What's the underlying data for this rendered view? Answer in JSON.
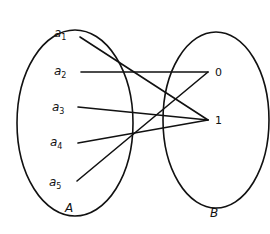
{
  "diagram": {
    "type": "function-mapping",
    "colors": {
      "stroke": "#111111",
      "background": "#ffffff"
    },
    "sets": [
      {
        "name": "A",
        "label": "A",
        "ellipse": {
          "cx": 75,
          "cy": 123,
          "rx": 58,
          "ry": 93
        },
        "label_pos": [
          65,
          212
        ]
      },
      {
        "name": "B",
        "label": "B",
        "ellipse": {
          "cx": 216,
          "cy": 120,
          "rx": 53,
          "ry": 88
        },
        "label_pos": [
          210,
          217
        ]
      }
    ],
    "elements_A": [
      {
        "id": "a1",
        "base": "a",
        "sub": "1",
        "pos": [
          68,
          37
        ],
        "anchor": [
          80,
          37
        ]
      },
      {
        "id": "a2",
        "base": "a",
        "sub": "2",
        "pos": [
          68,
          75
        ],
        "anchor": [
          81,
          72
        ]
      },
      {
        "id": "a3",
        "base": "a",
        "sub": "3",
        "pos": [
          66,
          111
        ],
        "anchor": [
          78,
          107
        ]
      },
      {
        "id": "a4",
        "base": "a",
        "sub": "4",
        "pos": [
          64,
          146
        ],
        "anchor": [
          78,
          143
        ]
      },
      {
        "id": "a5",
        "base": "a",
        "sub": "5",
        "pos": [
          63,
          186
        ],
        "anchor": [
          77,
          181
        ]
      }
    ],
    "elements_B": [
      {
        "id": "0",
        "label": "0",
        "pos": [
          215,
          76
        ],
        "anchor": [
          208,
          72
        ]
      },
      {
        "id": "1",
        "label": "1",
        "pos": [
          215,
          124
        ],
        "anchor": [
          208,
          120
        ]
      }
    ],
    "mappings": [
      {
        "from": "a1",
        "to": "1"
      },
      {
        "from": "a2",
        "to": "0"
      },
      {
        "from": "a3",
        "to": "1"
      },
      {
        "from": "a4",
        "to": "1"
      },
      {
        "from": "a5",
        "to": "0"
      }
    ]
  }
}
